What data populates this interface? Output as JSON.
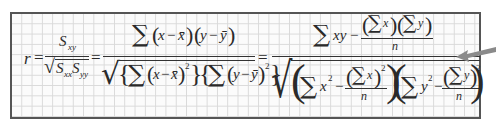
{
  "formula": {
    "description": "Pearson correlation coefficient formula",
    "lhs": "r",
    "eq": "=",
    "part1": {
      "num_base": "S",
      "num_sub": "xy",
      "den_base1": "S",
      "den_sub1": "xx",
      "den_base2": "S",
      "den_sub2": "yy"
    },
    "part2": {
      "numerator": "∑(x − x̄)(y − ȳ)",
      "denominator": "√{∑(x − x̄)²}{∑(y − ȳ)²}"
    },
    "part3": {
      "numerator_main": "∑xy −",
      "numerator_frac_top": "(∑x)(∑y)",
      "numerator_frac_bottom": "n",
      "denominator_left": "∑x² −",
      "denominator_left_frac_top": "(∑x)²",
      "denominator_left_frac_bottom": "n",
      "denominator_right": "∑y² −",
      "denominator_right_frac_top": "(∑y)²",
      "denominator_right_frac_bottom": "n"
    },
    "symbols": {
      "sigma": "∑",
      "sq": "2",
      "minus": "−",
      "x": "x",
      "y": "y",
      "n": "n",
      "xbar": "x̄",
      "ybar": "ȳ",
      "lparen": "(",
      "rparen": ")",
      "lbrace": "{",
      "rbrace": "}",
      "lbig": "(",
      "rbig": ")",
      "radical": "√",
      "equals": "="
    }
  },
  "colors": {
    "border": "#555555",
    "grid": "#d9d9d9",
    "ink": "#2a2a2a",
    "arrow": "#8a8a8a"
  },
  "annotation": {
    "arrow_direction": "left"
  }
}
